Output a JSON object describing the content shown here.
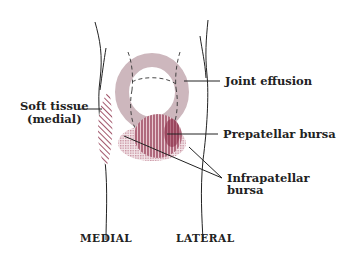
{
  "diagram": {
    "labels": {
      "joint_effusion": "Joint effusion",
      "soft_tissue_line1": "Soft tissue",
      "soft_tissue_line2": "(medial)",
      "prepatellar": "Prepatellar bursa",
      "infrapatellar_line1": "Infrapatellar",
      "infrapatellar_line2": "bursa"
    },
    "orientation": {
      "left": "MEDIAL",
      "right": "LATERAL"
    },
    "colors": {
      "effusion": "#cdb7bd",
      "prepatellar": "#8a2a45",
      "infrapatellar": "#c58a9a",
      "soft_tissue": "#8a2a45",
      "outline": "#222222"
    }
  }
}
